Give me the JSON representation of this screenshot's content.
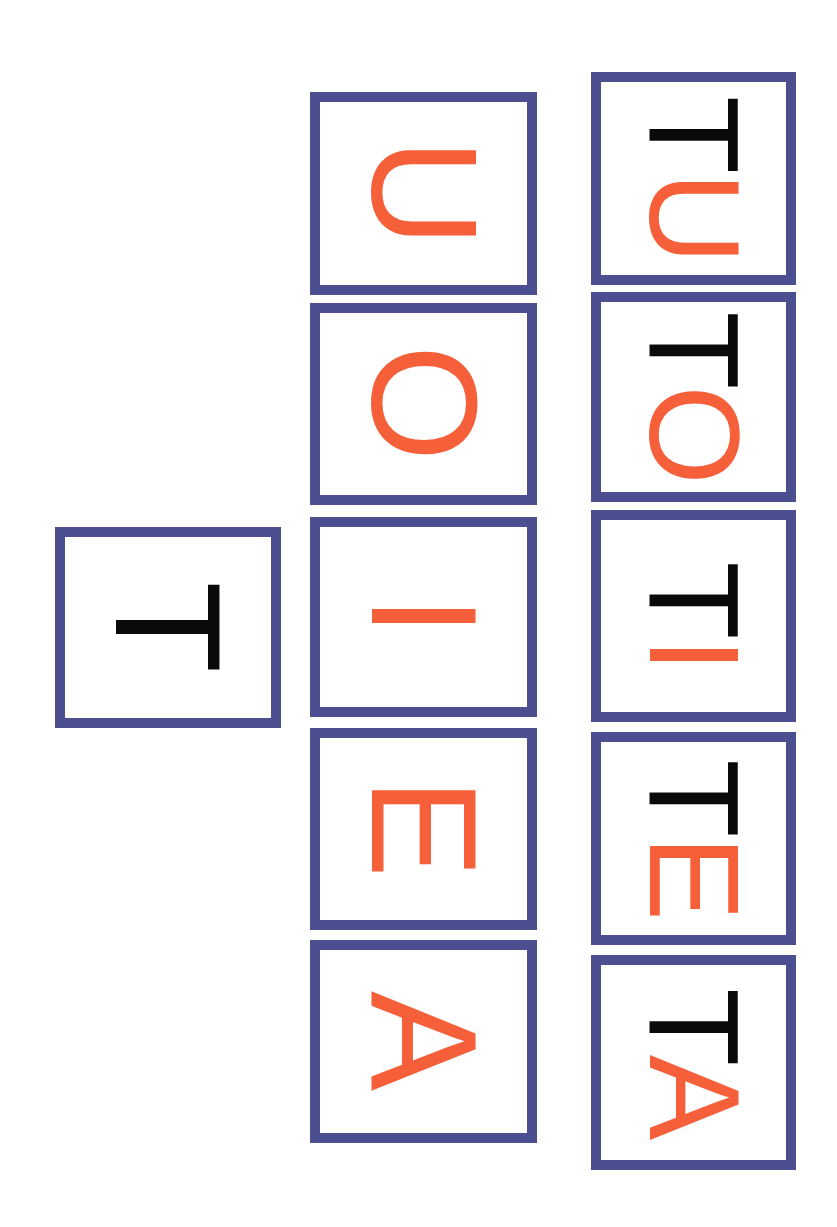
{
  "colors": {
    "border": "#4b4f8f",
    "consonant": "#0a0a0a",
    "vowel": "#f5603a",
    "background": "#ffffff"
  },
  "orientation": "letters rotated 90 degrees clockwise",
  "consonant_card": {
    "letter": "T"
  },
  "vowel_cards": [
    {
      "letter": "U"
    },
    {
      "letter": "O"
    },
    {
      "letter": "I"
    },
    {
      "letter": "E"
    },
    {
      "letter": "A"
    }
  ],
  "syllable_cards": [
    {
      "consonant": "T",
      "vowel": "U"
    },
    {
      "consonant": "T",
      "vowel": "O"
    },
    {
      "consonant": "T",
      "vowel": "I"
    },
    {
      "consonant": "T",
      "vowel": "E"
    },
    {
      "consonant": "T",
      "vowel": "A"
    }
  ]
}
